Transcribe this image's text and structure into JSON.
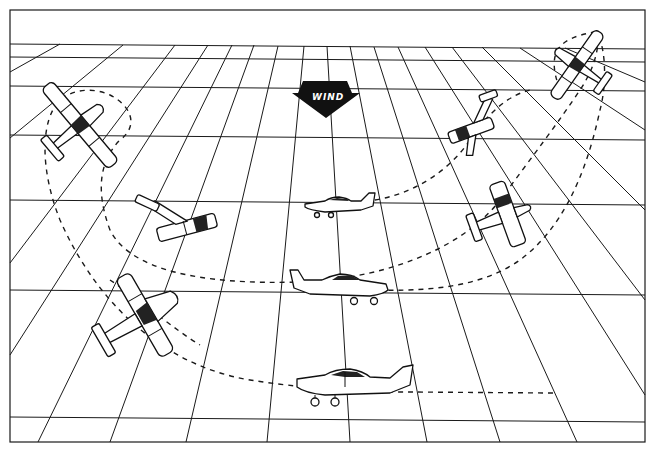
{
  "figure": {
    "wind_indicator": {
      "label": "WIND",
      "direction": "down (toward viewer)"
    },
    "colors": {
      "ink": "#1a1a1a",
      "background": "#ffffff"
    },
    "aircraft": [
      {
        "id": "plane-final-level",
        "view": "side",
        "position": "bottom center"
      },
      {
        "id": "plane-lower-banked-left",
        "view": "banked top",
        "position": "lower left"
      },
      {
        "id": "plane-upper-steep-left",
        "view": "steep bank",
        "position": "upper left"
      },
      {
        "id": "plane-mid-left",
        "view": "banked top",
        "position": "middle left"
      },
      {
        "id": "plane-mid-level",
        "view": "side",
        "position": "center"
      },
      {
        "id": "plane-upper-level",
        "view": "side",
        "position": "upper center"
      },
      {
        "id": "plane-mid-right",
        "view": "banked top",
        "position": "middle right"
      },
      {
        "id": "plane-upper-right",
        "view": "banked top",
        "position": "upper right"
      },
      {
        "id": "plane-top-right-steep",
        "view": "steep bank",
        "position": "top right"
      }
    ]
  }
}
